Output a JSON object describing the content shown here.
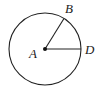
{
  "diagram": {
    "type": "circle-with-radii",
    "center": {
      "label": "A",
      "x": 45,
      "y": 49
    },
    "radius": 36,
    "points": [
      {
        "label": "B",
        "angle_deg": 58
      },
      {
        "label": "D",
        "angle_deg": 0
      }
    ],
    "segments": [
      "AB",
      "AD"
    ],
    "stroke_color": "#222222"
  },
  "labels": {
    "a": "A",
    "b": "B",
    "d": "D"
  }
}
